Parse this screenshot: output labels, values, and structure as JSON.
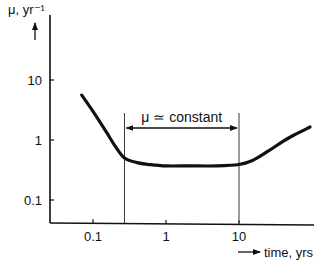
{
  "chart_data": {
    "type": "line",
    "title": "",
    "xlabel": "time, yrs",
    "ylabel": "μ, yr⁻¹",
    "xscale": "log",
    "yscale": "log",
    "xlim": [
      0.04,
      100
    ],
    "ylim": [
      0.07,
      100
    ],
    "grid": false,
    "legend": null,
    "x_ticks": [
      0.1,
      1,
      10
    ],
    "x_tick_labels": [
      "0.1",
      "1",
      "10"
    ],
    "y_ticks": [
      0.1,
      1,
      10
    ],
    "y_tick_labels": [
      "0.1",
      "1",
      "10"
    ],
    "series": [
      {
        "name": "mu",
        "x": [
          0.07,
          0.1,
          0.15,
          0.2,
          0.27,
          0.4,
          0.6,
          1,
          2,
          5,
          10,
          15,
          25,
          40,
          60,
          94
        ],
        "y": [
          5.6,
          3.0,
          1.4,
          0.8,
          0.5,
          0.42,
          0.39,
          0.37,
          0.37,
          0.37,
          0.39,
          0.45,
          0.65,
          0.95,
          1.25,
          1.65
        ]
      }
    ],
    "annotations": [
      {
        "text": "μ ≃ constant",
        "type": "double-arrow-span",
        "x_from": 0.27,
        "x_to": 10,
        "y": 1.5
      }
    ],
    "reference_lines": [
      {
        "orientation": "vertical",
        "x": 0.27
      },
      {
        "orientation": "vertical",
        "x": 10
      }
    ]
  }
}
